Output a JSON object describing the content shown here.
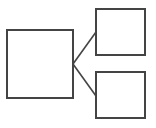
{
  "diagram": {
    "type": "tree",
    "canvas": {
      "width": 156,
      "height": 128,
      "background": "#ffffff"
    },
    "stroke_color": "#444444",
    "nodes": [
      {
        "id": "parent",
        "label": "",
        "x": 7,
        "y": 30,
        "w": 66,
        "h": 68
      },
      {
        "id": "child-top",
        "label": "",
        "x": 96,
        "y": 9,
        "w": 49,
        "h": 46
      },
      {
        "id": "child-bottom",
        "label": "",
        "x": 96,
        "y": 72,
        "w": 49,
        "h": 46
      }
    ],
    "edges": [
      {
        "from": "parent",
        "to": "child-top",
        "x1": 73,
        "y1": 64,
        "x2": 96,
        "y2": 32
      },
      {
        "from": "parent",
        "to": "child-bottom",
        "x1": 73,
        "y1": 64,
        "x2": 96,
        "y2": 96
      }
    ]
  }
}
